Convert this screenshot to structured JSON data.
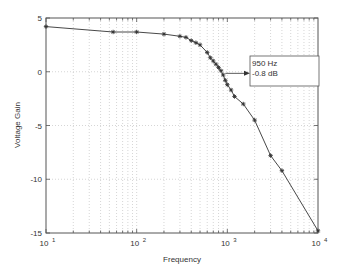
{
  "chart_data": {
    "type": "line",
    "title": "",
    "xlabel": "Frequency",
    "ylabel": "Voltage Gain",
    "xscale": "log",
    "xlim": [
      10,
      10000
    ],
    "ylim": [
      -15,
      5
    ],
    "grid": true,
    "x_ticks": [
      10,
      100,
      1000,
      10000
    ],
    "x_tick_labels": [
      {
        "base": "10",
        "exp": "1"
      },
      {
        "base": "10",
        "exp": "2"
      },
      {
        "base": "10",
        "exp": "3"
      },
      {
        "base": "10",
        "exp": "4"
      }
    ],
    "y_ticks": [
      5,
      0,
      -5,
      -10,
      -15
    ],
    "y_tick_labels": [
      "5",
      "0",
      "-5",
      "-10",
      "-15"
    ],
    "series": [
      {
        "name": "Voltage Gain",
        "marker": "*",
        "color": "#333333",
        "x": [
          10,
          55,
          100,
          200,
          300,
          350,
          400,
          450,
          500,
          600,
          650,
          700,
          750,
          800,
          850,
          900,
          950,
          1000,
          1100,
          1200,
          1500,
          2000,
          3000,
          4000,
          10000
        ],
        "y": [
          4.2,
          3.7,
          3.7,
          3.5,
          3.3,
          3.2,
          2.9,
          2.7,
          2.5,
          1.8,
          1.3,
          1.0,
          0.7,
          0.4,
          0.1,
          -0.3,
          -0.8,
          -1.2,
          -1.7,
          -2.3,
          -3.0,
          -4.5,
          -7.8,
          -9.2,
          -14.8
        ]
      }
    ],
    "annotations": [
      {
        "x": 950,
        "y": -0.8,
        "line1": "950 Hz",
        "line2": "-0.8 dB",
        "arrow": true
      }
    ]
  },
  "labels": {
    "xlabel": "Frequency",
    "ylabel": "Voltage Gain",
    "annotation_line1": "950 Hz",
    "annotation_line2": "-0.8 dB"
  }
}
